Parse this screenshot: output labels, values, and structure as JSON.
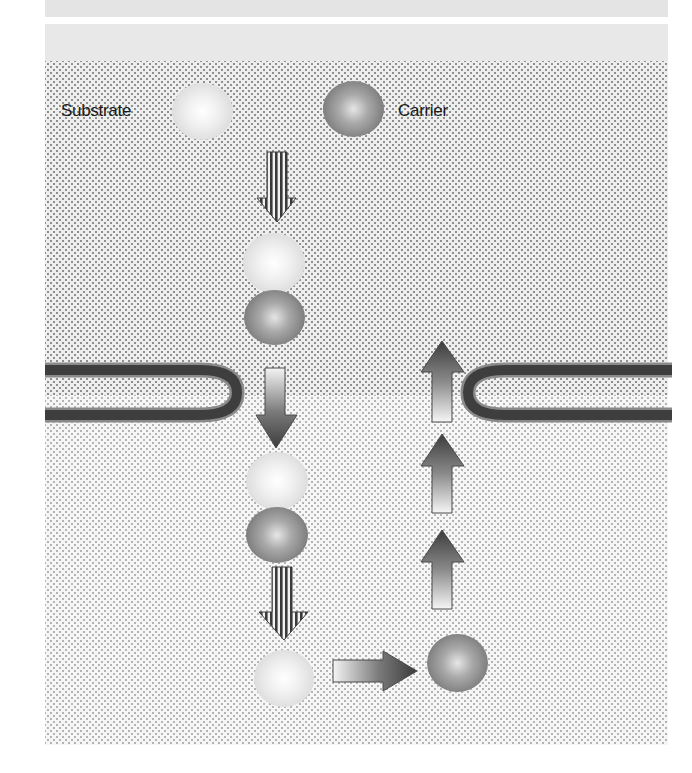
{
  "diagram": {
    "legend": {
      "substrate_label": "Substrate",
      "carrier_label": "Carrier"
    },
    "colors": {
      "upper_compartment": "#eeeeee",
      "lower_compartment": "#f6f6f6",
      "membrane": "#444444",
      "substrate": "#e8e8e8",
      "carrier": "#8a8a8a"
    },
    "nodes": [
      {
        "id": "legend-substrate",
        "type": "substrate"
      },
      {
        "id": "legend-carrier",
        "type": "carrier"
      },
      {
        "id": "complex-outside",
        "type": "substrate+carrier",
        "position": "above membrane"
      },
      {
        "id": "complex-inside",
        "type": "substrate+carrier",
        "position": "below membrane"
      },
      {
        "id": "released-substrate",
        "type": "substrate",
        "position": "inside"
      },
      {
        "id": "free-carrier",
        "type": "carrier",
        "position": "inside"
      }
    ],
    "arrows": [
      {
        "from": "legend",
        "to": "complex-outside",
        "style": "striped",
        "direction": "down"
      },
      {
        "from": "complex-outside",
        "to": "complex-inside",
        "style": "gradient",
        "direction": "down",
        "crosses": "membrane"
      },
      {
        "from": "complex-inside",
        "to": "released-substrate",
        "style": "striped",
        "direction": "down"
      },
      {
        "from": "released-substrate",
        "to": "free-carrier",
        "style": "gradient",
        "direction": "right"
      },
      {
        "from": "free-carrier",
        "to": "membrane",
        "style": "gradient",
        "direction": "up",
        "count": 3
      }
    ]
  }
}
